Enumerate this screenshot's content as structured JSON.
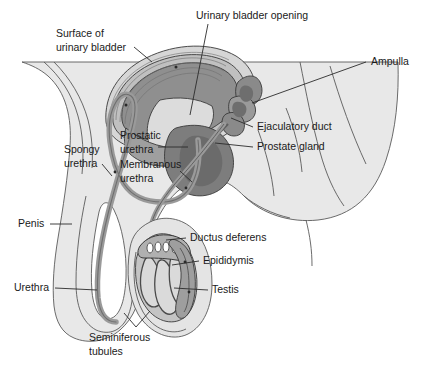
{
  "figure": {
    "kind": "anatomical-diagram",
    "width": 425,
    "height": 370,
    "background_color": "#ffffff"
  },
  "palette": {
    "page_background": "#ffffff",
    "body_fill": "#e8e8e8",
    "body_outline": "#5a5a5a",
    "bladder_light": "#d6d6d6",
    "bladder_mid": "#b8b8b8",
    "bladder_dark": "#8f8f8f",
    "prostate_dark": "#7d7d7d",
    "duct_gray": "#9a9a9a",
    "scrotum_fill": "#e0e0e0",
    "testis_fill": "#c9c9c9",
    "tubule_fill": "#d8d8d8",
    "label_text": "#1a1a1a",
    "leader_line": "#2b2b2b"
  },
  "labels": [
    {
      "id": "surface-of-urinary-bladder",
      "text": "Surface of",
      "text2": "urinary bladder",
      "x": 56,
      "y": 34,
      "anchor": "start",
      "leader": "M 134 47 L 152 62"
    },
    {
      "id": "urinary-bladder-opening",
      "text": "Urinary bladder opening",
      "x": 196,
      "y": 16,
      "anchor": "start",
      "leader": "M 208 24 L 190 115"
    },
    {
      "id": "ampulla",
      "text": "Ampulla",
      "x": 371,
      "y": 62,
      "anchor": "start",
      "leader": "M 366 62 L 252 103"
    },
    {
      "id": "ejaculatory-duct",
      "text": "Ejaculatory duct",
      "x": 257,
      "y": 127,
      "anchor": "start",
      "leader": "M 253 127 L 231 118"
    },
    {
      "id": "prostate-gland",
      "text": "Prostate gland",
      "x": 257,
      "y": 147,
      "anchor": "start",
      "leader": "M 253 147 L 215 143"
    },
    {
      "id": "prostatic-urethra",
      "text": "Prostatic",
      "text2": "urethra",
      "x": 120,
      "y": 136,
      "anchor": "start",
      "leader": "M 158 147 L 188 147"
    },
    {
      "id": "membranous-urethra",
      "text": "Membranous",
      "text2": "urethra",
      "x": 120,
      "y": 165,
      "anchor": "start",
      "leader": "M 180 171 L 192 182"
    },
    {
      "id": "spongy-urethra",
      "text": "Spongy",
      "text2": "urethra",
      "x": 64,
      "y": 150,
      "anchor": "start",
      "leader": "M 102 164 L 112 176"
    },
    {
      "id": "penis",
      "text": "Penis",
      "x": 18,
      "y": 224,
      "anchor": "start",
      "leader": "M 50 224 L 72 224"
    },
    {
      "id": "urethra",
      "text": "Urethra",
      "x": 14,
      "y": 288,
      "anchor": "start",
      "leader": "M 55 288 L 97 290"
    },
    {
      "id": "ductus-deferens",
      "text": "Ductus deferens",
      "x": 190,
      "y": 238,
      "anchor": "start",
      "leader": "M 186 238 L 166 240"
    },
    {
      "id": "epididymis",
      "text": "Epididymis",
      "x": 203,
      "y": 261,
      "anchor": "start",
      "leader": "M 199 261 L 172 265"
    },
    {
      "id": "testis",
      "text": "Testis",
      "x": 212,
      "y": 290,
      "anchor": "start",
      "leader": "M 208 290 L 174 288"
    },
    {
      "id": "seminiferous-tubules",
      "text": "Seminiferous",
      "text2": "tubules",
      "x": 89,
      "y": 338,
      "anchor": "start",
      "leader": "M 136 327 L 124 313 M 136 327 L 150 311"
    }
  ]
}
